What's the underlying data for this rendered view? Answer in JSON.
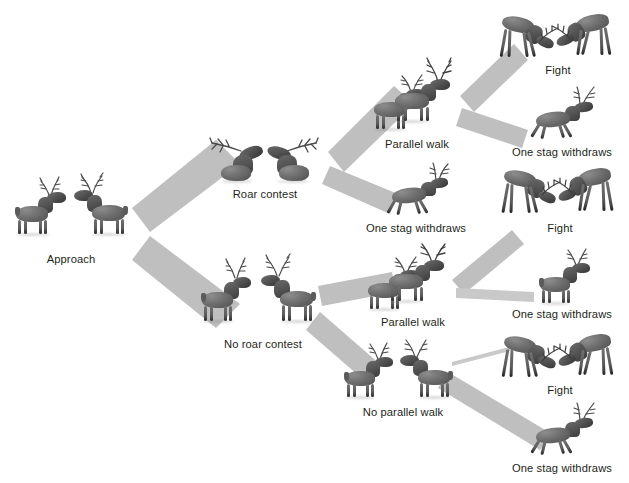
{
  "diagram": {
    "palette": {
      "band": "#bfbfbf",
      "band_light": "#cfcfcf",
      "thin_line": "#c9c9c9",
      "text": "#231f20",
      "background": "#ffffff"
    },
    "nodes": [
      {
        "id": "approach",
        "label": "Approach",
        "stage": 0,
        "x": 10,
        "y": 185,
        "w": 122,
        "h": 80,
        "figures": 2,
        "pose": "standing-pair"
      },
      {
        "id": "roar-contest",
        "label": "Roar contest",
        "stage": 1,
        "x": 195,
        "y": 128,
        "w": 140,
        "h": 72,
        "figures": 2,
        "pose": "roaring-pair"
      },
      {
        "id": "no-roar-contest",
        "label": "No roar contest",
        "stage": 1,
        "x": 193,
        "y": 262,
        "w": 140,
        "h": 88,
        "figures": 2,
        "pose": "standing-pair"
      },
      {
        "id": "parallel-walk-top",
        "label": "Parallel walk",
        "stage": 2,
        "x": 364,
        "y": 72,
        "w": 106,
        "h": 78,
        "figures": 2,
        "pose": "parallel-walk"
      },
      {
        "id": "withdraw-roar",
        "label": "One stag withdraws",
        "stage": 2,
        "x": 352,
        "y": 172,
        "w": 128,
        "h": 62,
        "figures": 1,
        "pose": "fleeing"
      },
      {
        "id": "parallel-walk-bottom",
        "label": "Parallel walk",
        "stage": 2,
        "x": 358,
        "y": 256,
        "w": 110,
        "h": 72,
        "figures": 2,
        "pose": "parallel-walk"
      },
      {
        "id": "no-parallel-walk",
        "label": "No parallel walk",
        "stage": 2,
        "x": 336,
        "y": 344,
        "w": 134,
        "h": 74,
        "figures": 2,
        "pose": "standing-pair"
      },
      {
        "id": "fight-top",
        "label": "Fight",
        "stage": 3,
        "x": 498,
        "y": 14,
        "w": 120,
        "h": 62,
        "figures": 2,
        "pose": "fighting"
      },
      {
        "id": "withdraw-pw-top",
        "label": "One stag withdraws",
        "stage": 3,
        "x": 498,
        "y": 96,
        "w": 128,
        "h": 62,
        "figures": 1,
        "pose": "fleeing"
      },
      {
        "id": "fight-middle",
        "label": "Fight",
        "stage": 3,
        "x": 500,
        "y": 168,
        "w": 120,
        "h": 66,
        "figures": 2,
        "pose": "fighting"
      },
      {
        "id": "withdraw-pw-bottom",
        "label": "One stag withdraws",
        "stage": 3,
        "x": 498,
        "y": 258,
        "w": 128,
        "h": 62,
        "figures": 1,
        "pose": "standing-single"
      },
      {
        "id": "fight-bottom",
        "label": "Fight",
        "stage": 3,
        "x": 500,
        "y": 334,
        "w": 120,
        "h": 62,
        "figures": 2,
        "pose": "fighting"
      },
      {
        "id": "withdraw-npw",
        "label": "One stag withdraws",
        "stage": 3,
        "x": 498,
        "y": 412,
        "w": 128,
        "h": 62,
        "figures": 1,
        "pose": "fleeing"
      }
    ],
    "edges": [
      {
        "id": "approach-to-roar",
        "from": "approach",
        "to": "roar-contest",
        "style": "band",
        "weight": "thick"
      },
      {
        "id": "approach-to-no-roar",
        "from": "approach",
        "to": "no-roar-contest",
        "style": "band",
        "weight": "thick"
      },
      {
        "id": "roar-to-parallel-walk",
        "from": "roar-contest",
        "to": "parallel-walk-top",
        "style": "band",
        "weight": "thick"
      },
      {
        "id": "roar-to-withdraw",
        "from": "roar-contest",
        "to": "withdraw-roar",
        "style": "band",
        "weight": "thick"
      },
      {
        "id": "no-roar-to-parallel-walk",
        "from": "no-roar-contest",
        "to": "parallel-walk-bottom",
        "style": "band",
        "weight": "thick"
      },
      {
        "id": "no-roar-to-no-parallel",
        "from": "no-roar-contest",
        "to": "no-parallel-walk",
        "style": "band",
        "weight": "thick"
      },
      {
        "id": "pw-top-to-fight",
        "from": "parallel-walk-top",
        "to": "fight-top",
        "style": "band",
        "weight": "medium"
      },
      {
        "id": "pw-top-to-withdraw",
        "from": "parallel-walk-top",
        "to": "withdraw-pw-top",
        "style": "band",
        "weight": "medium"
      },
      {
        "id": "pw-bottom-to-fight",
        "from": "parallel-walk-bottom",
        "to": "fight-middle",
        "style": "band",
        "weight": "medium"
      },
      {
        "id": "pw-bottom-to-withdraw",
        "from": "parallel-walk-bottom",
        "to": "withdraw-pw-bottom",
        "style": "band",
        "weight": "thin-band"
      },
      {
        "id": "npw-to-fight",
        "from": "no-parallel-walk",
        "to": "fight-bottom",
        "style": "hairline",
        "weight": "hairline"
      },
      {
        "id": "npw-to-withdraw",
        "from": "no-parallel-walk",
        "to": "withdraw-npw",
        "style": "band",
        "weight": "thick"
      }
    ]
  }
}
